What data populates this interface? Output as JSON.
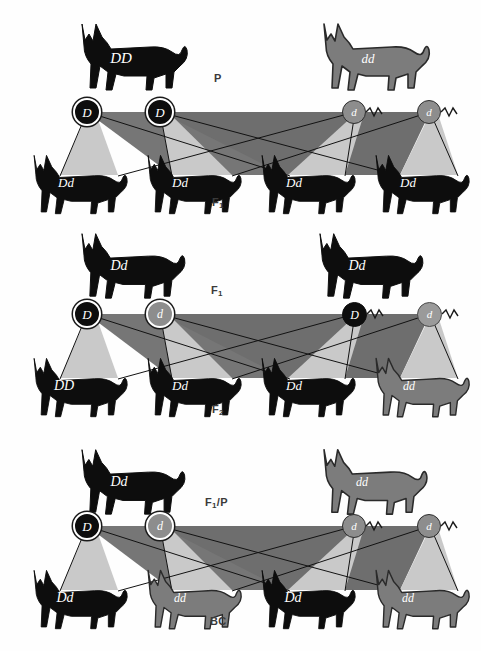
{
  "diagram": {
    "colors": {
      "black_cat": "#0d0d0d",
      "gray_cat": "#7c7c7c",
      "gray_cat_outline": "#2a2a2a",
      "ribbon_light": "#c9c9c9",
      "ribbon_dark": "#8a8a8a",
      "ribbon_darkest": "#5e5e5e",
      "line": "#121212",
      "label_text": "#3a3a3a",
      "genotype_text": "#ffffff",
      "background": "#ffffff"
    }
  },
  "panels": [
    {
      "id": "panel-p-to-f1",
      "cross_label": "P",
      "offspring_label": "F₁",
      "cross_label_html": "P",
      "offspring_label_html": "F<sub>1</sub>",
      "parents": [
        {
          "genotype": "DD",
          "coat": "black",
          "position": "left"
        },
        {
          "genotype": "dd",
          "coat": "gray",
          "position": "right"
        }
      ],
      "gametes": [
        {
          "allele": "D",
          "type": "egg",
          "style": "black-ring"
        },
        {
          "allele": "D",
          "type": "egg",
          "style": "black-ring"
        },
        {
          "allele": "d",
          "type": "sperm",
          "style": "gray-plain"
        },
        {
          "allele": "d",
          "type": "sperm",
          "style": "gray-plain"
        }
      ],
      "offspring": [
        {
          "genotype": "Dd",
          "coat": "black"
        },
        {
          "genotype": "Dd",
          "coat": "black"
        },
        {
          "genotype": "Dd",
          "coat": "black"
        },
        {
          "genotype": "Dd",
          "coat": "black"
        }
      ]
    },
    {
      "id": "panel-f1-to-f2",
      "cross_label": "F₁",
      "offspring_label": "F₂",
      "cross_label_html": "F<sub>1</sub>",
      "offspring_label_html": "F<sub>2</sub>",
      "parents": [
        {
          "genotype": "Dd",
          "coat": "black",
          "position": "left"
        },
        {
          "genotype": "Dd",
          "coat": "black",
          "position": "right"
        }
      ],
      "gametes": [
        {
          "allele": "D",
          "type": "egg",
          "style": "black-ring"
        },
        {
          "allele": "d",
          "type": "egg",
          "style": "gray-ring"
        },
        {
          "allele": "D",
          "type": "sperm",
          "style": "black-plain"
        },
        {
          "allele": "d",
          "type": "sperm",
          "style": "gray-plain"
        }
      ],
      "offspring": [
        {
          "genotype": "DD",
          "coat": "black"
        },
        {
          "genotype": "Dd",
          "coat": "black"
        },
        {
          "genotype": "Dd",
          "coat": "black"
        },
        {
          "genotype": "dd",
          "coat": "gray"
        }
      ]
    },
    {
      "id": "panel-backcross",
      "cross_label": "F₁/P",
      "offspring_label": "BC",
      "cross_label_html": "F<sub>1</sub>/P",
      "offspring_label_html": "BC",
      "parents": [
        {
          "genotype": "Dd",
          "coat": "black",
          "position": "left"
        },
        {
          "genotype": "dd",
          "coat": "gray",
          "position": "right"
        }
      ],
      "gametes": [
        {
          "allele": "D",
          "type": "egg",
          "style": "black-ring"
        },
        {
          "allele": "d",
          "type": "egg",
          "style": "gray-ring"
        },
        {
          "allele": "d",
          "type": "sperm",
          "style": "gray-plain"
        },
        {
          "allele": "d",
          "type": "sperm",
          "style": "gray-plain"
        }
      ],
      "offspring": [
        {
          "genotype": "Dd",
          "coat": "black"
        },
        {
          "genotype": "dd",
          "coat": "gray"
        },
        {
          "genotype": "Dd",
          "coat": "black"
        },
        {
          "genotype": "dd",
          "coat": "gray"
        }
      ]
    }
  ]
}
